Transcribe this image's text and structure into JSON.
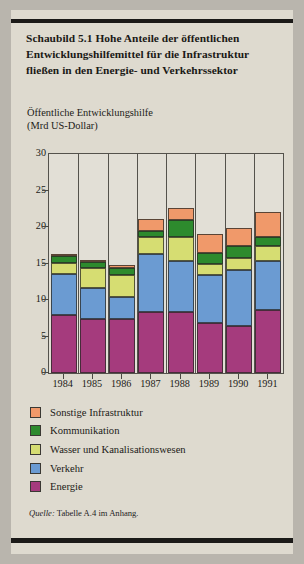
{
  "figure": {
    "title": "Schaubild 5.1  Hohe Anteile der öffentlichen Entwicklungshilfemittel für die Infrastruktur fließen in den Energie- und Verkehrssektor",
    "source_prefix": "Quelle:",
    "source_text": " Tabelle A.4 im Anhang."
  },
  "chart_data": {
    "type": "bar",
    "subtype": "stacked",
    "title": "Schaubild 5.1  Hohe Anteile der öffentlichen Entwicklungshilfemittel für die Infrastruktur fließen in den Energie- und Verkehrssektor",
    "axis_caption_line1": "Öffentliche Entwicklungshilfe",
    "axis_caption_line2": "(Mrd US-Dollar)",
    "xlabel": "",
    "ylabel": "Öffentliche Entwicklungshilfe (Mrd US-Dollar)",
    "ylim": [
      0,
      30
    ],
    "yticks": [
      0,
      5,
      10,
      15,
      20,
      25,
      30
    ],
    "ytick_labels": [
      "0",
      "5",
      "10",
      "15",
      "20",
      "25",
      "30"
    ],
    "grid": "vertical-only",
    "legend_position": "below-plot",
    "categories": [
      "1984",
      "1985",
      "1986",
      "1987",
      "1988",
      "1989",
      "1990",
      "1991"
    ],
    "series": [
      {
        "name": "Energie",
        "color": "#a53b7d",
        "values": [
          8.0,
          7.4,
          7.4,
          8.3,
          8.3,
          6.8,
          6.5,
          8.6
        ]
      },
      {
        "name": "Verkehr",
        "color": "#6b9bd2",
        "values": [
          5.6,
          4.2,
          3.0,
          8.0,
          7.1,
          6.6,
          7.6,
          6.8
        ]
      },
      {
        "name": "Wasser und Kanalisationswesen",
        "color": "#d6dd72",
        "values": [
          1.5,
          2.8,
          3.0,
          2.3,
          3.3,
          1.5,
          1.6,
          2.0
        ]
      },
      {
        "name": "Kommunikation",
        "color": "#2d8a2d",
        "values": [
          0.9,
          0.8,
          1.0,
          0.9,
          2.3,
          1.6,
          1.7,
          1.3
        ]
      },
      {
        "name": "Sonstige Infrastruktur",
        "color": "#f0996a",
        "values": [
          0.3,
          0.3,
          0.4,
          1.6,
          1.6,
          2.5,
          2.4,
          3.3
        ]
      }
    ],
    "totals": [
      16.3,
      15.5,
      14.8,
      21.1,
      22.6,
      19.0,
      19.8,
      22.0
    ]
  },
  "legend": {
    "items": [
      {
        "label": "Sonstige Infrastruktur",
        "color": "#f0996a"
      },
      {
        "label": "Kommunikation",
        "color": "#2d8a2d"
      },
      {
        "label": "Wasser und Kanalisationswesen",
        "color": "#d6dd72"
      },
      {
        "label": "Verkehr",
        "color": "#6b9bd2"
      },
      {
        "label": "Energie",
        "color": "#a53b7d"
      }
    ]
  }
}
